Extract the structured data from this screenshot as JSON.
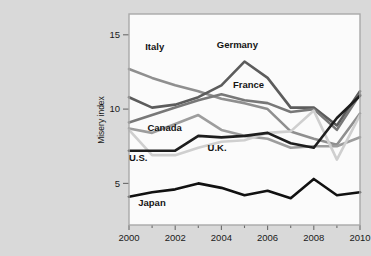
{
  "chart_data": {
    "type": "line",
    "title": "",
    "xlabel": "",
    "ylabel": "Misery index",
    "x": [
      2000,
      2001,
      2002,
      2003,
      2004,
      2005,
      2006,
      2007,
      2008,
      2009,
      2010
    ],
    "xlim": [
      2000,
      2010
    ],
    "ylim": [
      2.2,
      16.4
    ],
    "xticks": [
      2000,
      2002,
      2004,
      2006,
      2008,
      2010
    ],
    "xtick_labels": [
      "2000",
      "2002",
      "2004",
      "2006",
      "2008",
      "2010"
    ],
    "xminorticks": [
      2001,
      2003,
      2005,
      2007,
      2009
    ],
    "yticks": [
      5,
      10,
      15
    ],
    "ytick_labels": [
      "5",
      "10",
      "15"
    ],
    "grid": false,
    "legend_position": "inline-labels",
    "series": [
      {
        "name": "Italy",
        "color": "#8f8f8f",
        "width": 2.6,
        "label": "Italy",
        "label_x": 2000.7,
        "label_y": 14.0,
        "values": [
          12.7,
          12.1,
          11.6,
          11.2,
          10.7,
          10.4,
          10.0,
          8.5,
          8.0,
          7.6,
          9.7
        ]
      },
      {
        "name": "Germany",
        "color": "#5c5c5c",
        "width": 2.6,
        "label": "Germany",
        "label_x": 2003.8,
        "label_y": 14.1,
        "values": [
          10.8,
          10.1,
          10.3,
          10.8,
          11.6,
          13.2,
          12.1,
          10.1,
          10.1,
          8.9,
          11.2
        ]
      },
      {
        "name": "France",
        "color": "#787878",
        "width": 2.6,
        "label": "France",
        "label_x": 2004.5,
        "label_y": 11.4,
        "values": [
          9.1,
          9.6,
          10.1,
          10.6,
          11.0,
          10.6,
          10.4,
          9.8,
          10.0,
          8.6,
          11.0
        ]
      },
      {
        "name": "Canada",
        "color": "#9d9d9d",
        "width": 2.6,
        "label": "Canada",
        "label_x": 2000.8,
        "label_y": 8.5,
        "values": [
          8.7,
          8.4,
          9.0,
          9.6,
          8.6,
          8.2,
          8.0,
          7.4,
          7.5,
          7.5,
          8.1
        ]
      },
      {
        "name": "U.K.",
        "color": "#cfcfcf",
        "width": 2.6,
        "label": "U.K.",
        "label_x": 2003.4,
        "label_y": 7.2,
        "values": [
          8.6,
          6.9,
          6.9,
          7.4,
          7.8,
          7.9,
          8.4,
          8.5,
          9.9,
          6.6,
          9.6
        ]
      },
      {
        "name": "U.S.",
        "color": "#1e1e1e",
        "width": 2.6,
        "label": "U.S.",
        "label_x": 2000.0,
        "label_y": 6.5,
        "values": [
          7.2,
          7.2,
          7.2,
          8.2,
          8.1,
          8.2,
          8.4,
          7.7,
          7.4,
          9.4,
          10.9
        ]
      },
      {
        "name": "Japan",
        "color": "#111111",
        "width": 2.6,
        "label": "Japan",
        "label_x": 2000.4,
        "label_y": 3.5,
        "values": [
          4.1,
          4.4,
          4.6,
          5.0,
          4.7,
          4.2,
          4.5,
          4.0,
          5.3,
          4.2,
          4.4
        ]
      }
    ]
  },
  "figure": {
    "background_color": "#d9d9d9",
    "plot_background_color": "#fbfbfb",
    "frame_color": "#a9a9a9"
  }
}
